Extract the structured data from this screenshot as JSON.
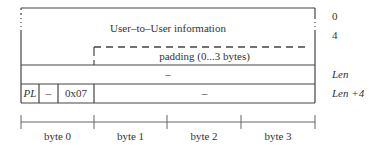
{
  "diagram": {
    "rows": {
      "user_info": "User–to–User information",
      "padding": "padding (0...3 bytes)",
      "len_row": "–",
      "last_row": {
        "pl": "PL",
        "dash": "–",
        "code": "0x07",
        "rest": "–"
      }
    },
    "offsets": [
      "0",
      "4",
      "Len",
      "Len +4"
    ],
    "bytes": [
      "byte 0",
      "byte 1",
      "byte 2",
      "byte 3"
    ]
  }
}
